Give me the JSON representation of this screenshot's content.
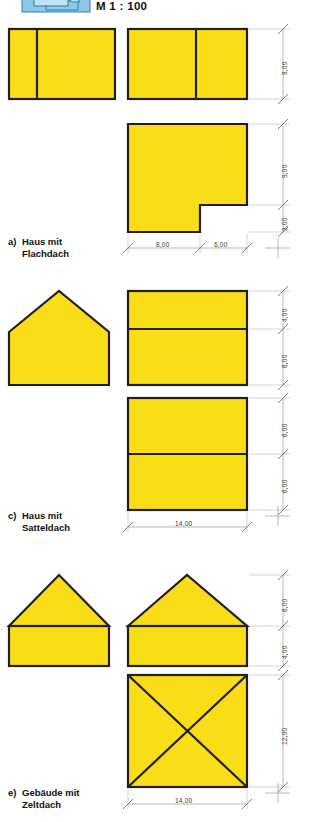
{
  "figure": {
    "scale_note": "M 1 : 100",
    "icon": "cad-layer-icon",
    "fill_color": "#F9DD16",
    "outline_color": "#231F20",
    "dimension_color": "#8A8A8A",
    "background_color": "#FFFFFF"
  },
  "sections": [
    {
      "id": "a",
      "letter": "a)",
      "title_line1": "Haus mit",
      "title_line2": "Flachdach",
      "caption": "a) Haus mit Flachdach",
      "vertical_dimensions": [
        "8,00",
        "9,00",
        "3,00"
      ],
      "horizontal_dimensions": [
        "8,00",
        "6,00"
      ]
    },
    {
      "id": "c",
      "letter": "c)",
      "title_line1": "Haus mit",
      "title_line2": "Satteldach",
      "caption": "c) Haus mit Satteldach",
      "vertical_dimensions": [
        "4,00",
        "6,00",
        "6,00",
        "6,00"
      ],
      "horizontal_dimensions": [
        "14,00"
      ]
    },
    {
      "id": "e",
      "letter": "e)",
      "title_line1": "Gebäude mit",
      "title_line2": "Zeltdach",
      "caption": "e) Gebäude mit Zeltdach",
      "vertical_dimensions": [
        "6,00",
        "4,00",
        "12,00"
      ],
      "horizontal_dimensions": [
        "14,00"
      ]
    }
  ],
  "dims": {
    "a_v_8": "8,00",
    "a_v_9": "9,00",
    "a_v_3": "3,00",
    "a_h_8": "8,00",
    "a_h_6": "6,00",
    "c_v_4": "4,00",
    "c_v_6a": "6,00",
    "c_v_6b": "6,00",
    "c_v_6c": "6,00",
    "c_h_14": "14,00",
    "e_v_6": "6,00",
    "e_v_4": "4,00",
    "e_v_12": "12,00",
    "e_h_14": "14,00"
  }
}
